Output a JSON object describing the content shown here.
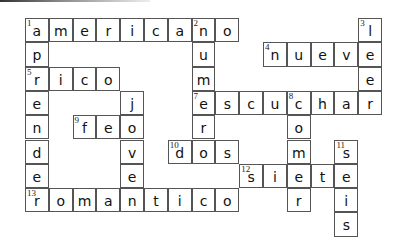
{
  "puzzle": {
    "type": "crossword",
    "columns": 15,
    "rows": 9,
    "cell_width": 23.8,
    "cell_height": 24.3,
    "border_color": "#555555",
    "words": [
      {
        "number": 1,
        "direction": "across",
        "answer": "americano",
        "row": 0,
        "col": 0
      },
      {
        "number": 1,
        "direction": "down",
        "answer": "aprender",
        "row": 0,
        "col": 0
      },
      {
        "number": 2,
        "direction": "down",
        "answer": "numero",
        "row": 0,
        "col": 7
      },
      {
        "number": 3,
        "direction": "down",
        "answer": "leer",
        "row": 0,
        "col": 14
      },
      {
        "number": 4,
        "direction": "across",
        "answer": "nueve",
        "row": 1,
        "col": 10
      },
      {
        "number": 5,
        "direction": "across",
        "answer": "rico",
        "row": 2,
        "col": 0
      },
      {
        "number": 6,
        "direction": "down",
        "answer": "joven",
        "row": 3,
        "col": 4
      },
      {
        "number": 7,
        "direction": "across",
        "answer": "escuchar",
        "row": 3,
        "col": 7
      },
      {
        "number": 8,
        "direction": "down",
        "answer": "comer",
        "row": 3,
        "col": 11
      },
      {
        "number": 9,
        "direction": "across",
        "answer": "feo",
        "row": 4,
        "col": 2
      },
      {
        "number": 10,
        "direction": "across",
        "answer": "dos",
        "row": 5,
        "col": 6
      },
      {
        "number": 11,
        "direction": "down",
        "answer": "seis",
        "row": 5,
        "col": 13
      },
      {
        "number": 12,
        "direction": "across",
        "answer": "siete",
        "row": 6,
        "col": 9
      },
      {
        "number": 13,
        "direction": "across",
        "answer": "romantico",
        "row": 7,
        "col": 0
      }
    ],
    "numbered_cells": [
      {
        "number": 1,
        "row": 0,
        "col": 0
      },
      {
        "number": 2,
        "row": 0,
        "col": 7
      },
      {
        "number": 3,
        "row": 0,
        "col": 14
      },
      {
        "number": 4,
        "row": 1,
        "col": 10
      },
      {
        "number": 5,
        "row": 2,
        "col": 0
      },
      {
        "number": 7,
        "row": 3,
        "col": 7
      },
      {
        "number": 8,
        "row": 3,
        "col": 11
      },
      {
        "number": 9,
        "row": 4,
        "col": 2
      },
      {
        "number": 10,
        "row": 5,
        "col": 6
      },
      {
        "number": 11,
        "row": 5,
        "col": 13
      },
      {
        "number": 12,
        "row": 6,
        "col": 9
      },
      {
        "number": 13,
        "row": 7,
        "col": 0
      }
    ]
  }
}
